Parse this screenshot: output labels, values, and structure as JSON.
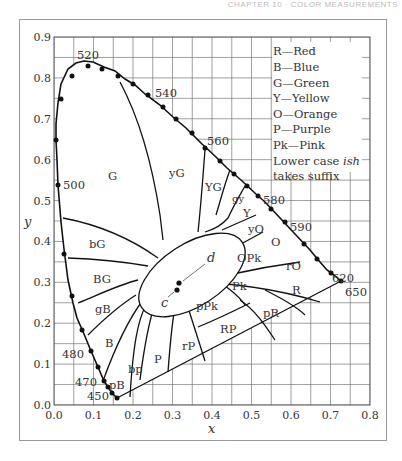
{
  "header": {
    "running_head": "CHAPTER 10 · COLOR MEASUREMENTS"
  },
  "chart_data": {
    "type": "diagram",
    "xlabel": "x",
    "ylabel": "y",
    "xlim": [
      0.0,
      0.8
    ],
    "ylim": [
      0.0,
      0.9
    ],
    "grid": true,
    "grid_step": 0.05,
    "x_ticks": [
      "0.0",
      "0.1",
      "0.2",
      "0.3",
      "0.4",
      "0.5",
      "0.6",
      "0.7",
      "0.8"
    ],
    "y_ticks": [
      "0.0",
      "0.1",
      "0.2",
      "0.3",
      "0.4",
      "0.5",
      "0.6",
      "0.7",
      "0.8",
      "0.9"
    ],
    "wavelength_labels": [
      {
        "nm": "450",
        "x": 0.157,
        "y": 0.018
      },
      {
        "nm": "470",
        "x": 0.124,
        "y": 0.058
      },
      {
        "nm": "480",
        "x": 0.091,
        "y": 0.133
      },
      {
        "nm": "500",
        "x": 0.008,
        "y": 0.538
      },
      {
        "nm": "520",
        "x": 0.074,
        "y": 0.834
      },
      {
        "nm": "540",
        "x": 0.23,
        "y": 0.754
      },
      {
        "nm": "560",
        "x": 0.373,
        "y": 0.624
      },
      {
        "nm": "580",
        "x": 0.512,
        "y": 0.487
      },
      {
        "nm": "590",
        "x": 0.575,
        "y": 0.424
      },
      {
        "nm": "620",
        "x": 0.691,
        "y": 0.308
      },
      {
        "nm": "650",
        "x": 0.726,
        "y": 0.274
      }
    ],
    "regions": [
      "G",
      "yG",
      "YG",
      "gy",
      "Y",
      "yO",
      "O",
      "rO",
      "R",
      "pR",
      "RP",
      "rP",
      "P",
      "bp",
      "pB",
      "B",
      "gB",
      "BG",
      "bG",
      "OPk",
      "Pk",
      "pPk"
    ],
    "points": [
      {
        "label": "c",
        "x": 0.31,
        "y": 0.316
      },
      {
        "label": "d",
        "x": 0.313,
        "y": 0.33
      }
    ],
    "legend": [
      "R—Red",
      "B—Blue",
      "G—Green",
      "Y—Yellow",
      "O—Orange",
      "P—Purple",
      "Pk—Pink",
      "Lower case ish",
      "takes suffix"
    ]
  },
  "legend_italic_word": "ish"
}
